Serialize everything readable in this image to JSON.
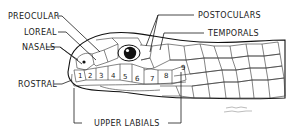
{
  "diagram": {
    "labels": {
      "preocular": "PREOCULAR",
      "loreal": "LOREAL",
      "nasals": "NASALS",
      "rostral": "ROSTRAL",
      "postoculars": "POSTOCULARS",
      "temporals": "TEMPORALS",
      "upper_labials": "UPPER LABIALS"
    },
    "labial_numbers": [
      "1",
      "2",
      "3",
      "4",
      "5",
      "6",
      "7",
      "8",
      "9"
    ],
    "signature": "artist signature",
    "colors": {
      "ink": "#1a1a1a",
      "background": "#ffffff"
    }
  }
}
